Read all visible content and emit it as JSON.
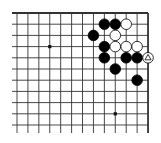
{
  "board": {
    "columns": 13,
    "rows": 11,
    "origin_x": 17,
    "origin_y": 13,
    "spacing_x": 10.92,
    "spacing_y": 11.2,
    "edges": {
      "top": true,
      "right": true,
      "left": false,
      "bottom": false
    },
    "line_color": "#333333",
    "background": "#ffffff",
    "star_points": [
      [
        3,
        3
      ],
      [
        3,
        9
      ],
      [
        9,
        9
      ]
    ],
    "stones": [
      {
        "color": "black",
        "col": 8,
        "row": 1
      },
      {
        "color": "black",
        "col": 9,
        "row": 1
      },
      {
        "color": "white",
        "col": 10,
        "row": 1
      },
      {
        "color": "black",
        "col": 7,
        "row": 2
      },
      {
        "color": "white",
        "col": 9,
        "row": 2
      },
      {
        "color": "black",
        "col": 8,
        "row": 3
      },
      {
        "color": "white",
        "col": 9,
        "row": 3
      },
      {
        "color": "white",
        "col": 10,
        "row": 3
      },
      {
        "color": "white",
        "col": 11,
        "row": 3
      },
      {
        "color": "black",
        "col": 8,
        "row": 4
      },
      {
        "color": "black",
        "col": 10,
        "row": 4
      },
      {
        "color": "black",
        "col": 11,
        "row": 4
      },
      {
        "color": "white",
        "col": 12,
        "row": 4,
        "marker": "triangle"
      },
      {
        "color": "black",
        "col": 9,
        "row": 5
      },
      {
        "color": "black",
        "col": 11,
        "row": 6
      }
    ]
  }
}
